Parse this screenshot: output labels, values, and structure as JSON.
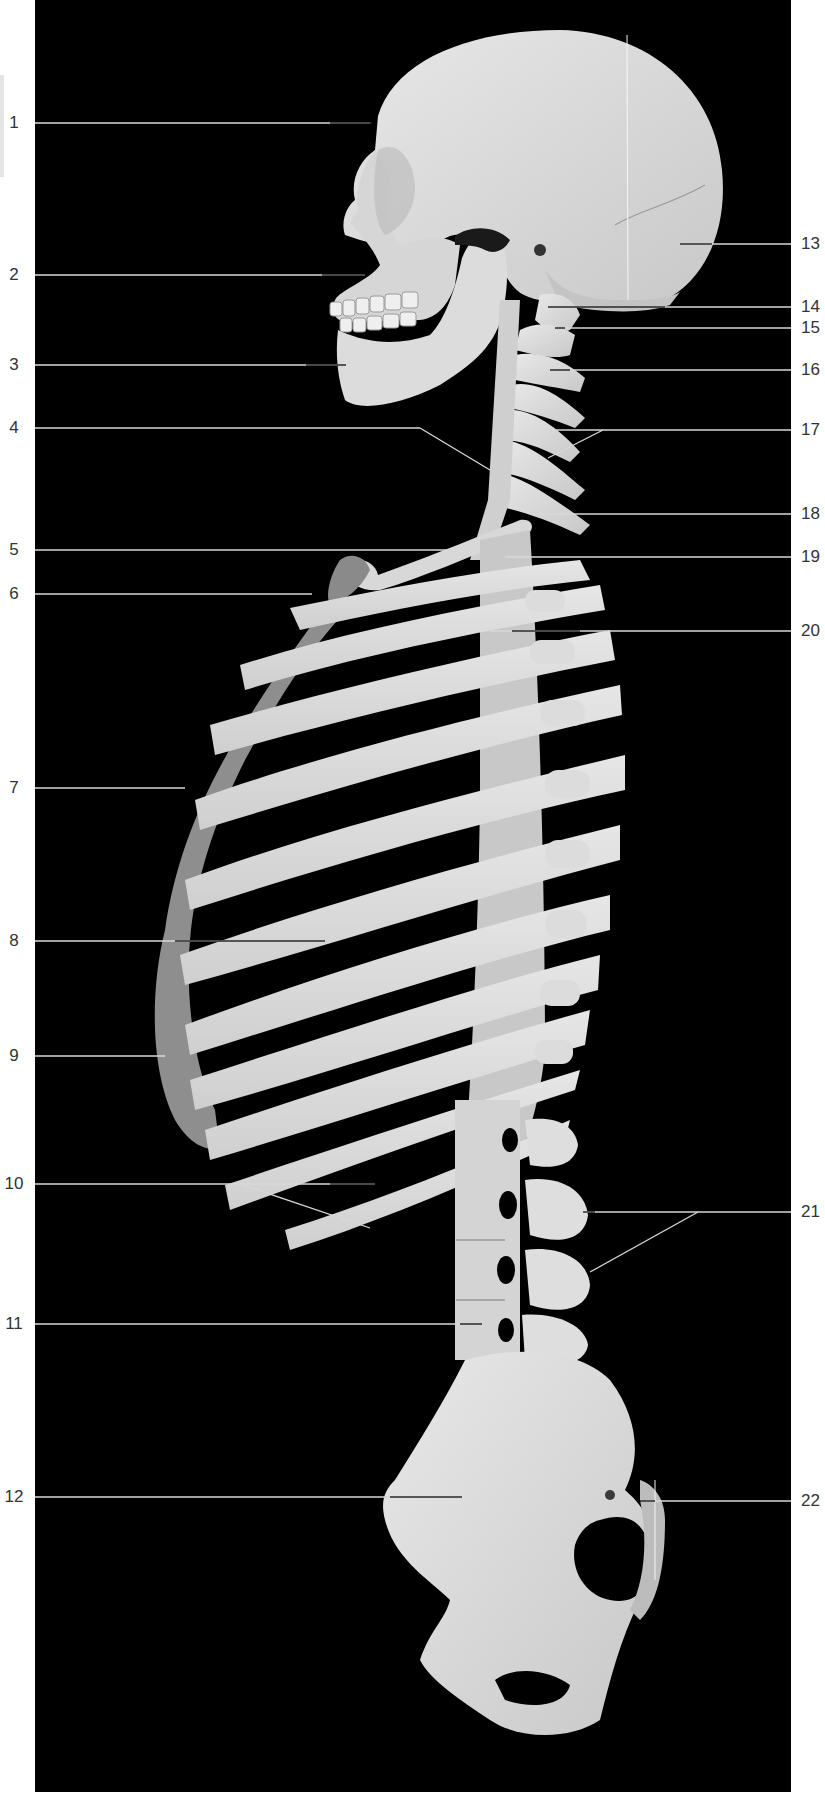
{
  "figure": {
    "view": "lateral view of axial skeleton (skull, vertebral column, thoracic cage, pelvis)",
    "background_color": "#000000",
    "bone_color": "#dcdcdc",
    "cartilage_color": "#8a8a8a",
    "leader_line_color": "#d8d8d8",
    "label_color": "#333333"
  },
  "labels_left": [
    {
      "id": "1",
      "text": "1",
      "y": 123
    },
    {
      "id": "2",
      "text": "2",
      "y": 275
    },
    {
      "id": "3",
      "text": "3",
      "y": 365
    },
    {
      "id": "4",
      "text": "4",
      "y": 428
    },
    {
      "id": "5",
      "text": "5",
      "y": 550
    },
    {
      "id": "6",
      "text": "6",
      "y": 594
    },
    {
      "id": "7",
      "text": "7",
      "y": 788
    },
    {
      "id": "8",
      "text": "8",
      "y": 941
    },
    {
      "id": "9",
      "text": "9",
      "y": 1056
    },
    {
      "id": "10",
      "text": "10",
      "y": 1184
    },
    {
      "id": "11",
      "text": "11",
      "y": 1324
    },
    {
      "id": "12",
      "text": "12",
      "y": 1497
    }
  ],
  "labels_right": [
    {
      "id": "13",
      "text": "13",
      "y": 244
    },
    {
      "id": "14",
      "text": "14",
      "y": 307
    },
    {
      "id": "15",
      "text": "15",
      "y": 328
    },
    {
      "id": "16",
      "text": "16",
      "y": 370
    },
    {
      "id": "17",
      "text": "17",
      "y": 430
    },
    {
      "id": "18",
      "text": "18",
      "y": 514
    },
    {
      "id": "19",
      "text": "19",
      "y": 557
    },
    {
      "id": "20",
      "text": "20",
      "y": 631
    },
    {
      "id": "21",
      "text": "21",
      "y": 1212
    },
    {
      "id": "22",
      "text": "22",
      "y": 1501
    }
  ]
}
